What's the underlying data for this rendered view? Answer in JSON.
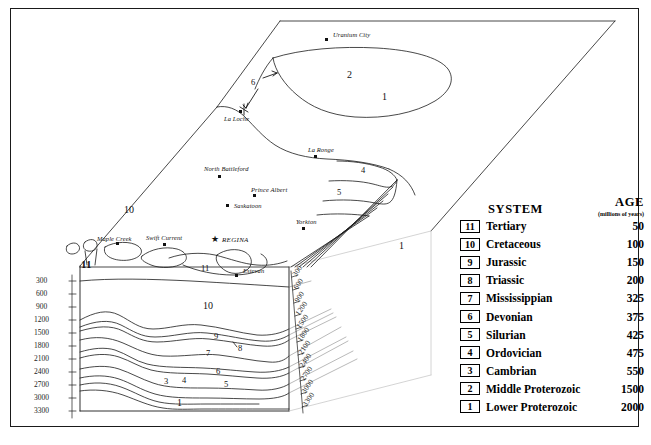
{
  "legend": {
    "system_header": "SYSTEM",
    "age_header": "AGE",
    "age_subheader": "(millions of years)",
    "rows": [
      {
        "num": "11",
        "name": "Tertiary",
        "age": "50"
      },
      {
        "num": "10",
        "name": "Cretaceous",
        "age": "100"
      },
      {
        "num": "9",
        "name": "Jurassic",
        "age": "150"
      },
      {
        "num": "8",
        "name": "Triassic",
        "age": "200"
      },
      {
        "num": "7",
        "name": "Mississippian",
        "age": "325"
      },
      {
        "num": "6",
        "name": "Devonian",
        "age": "375"
      },
      {
        "num": "5",
        "name": "Silurian",
        "age": "425"
      },
      {
        "num": "4",
        "name": "Ordovician",
        "age": "475"
      },
      {
        "num": "3",
        "name": "Cambrian",
        "age": "550"
      },
      {
        "num": "2",
        "name": "Middle Proterozoic",
        "age": "1500"
      },
      {
        "num": "1",
        "name": "Lower Proterozoic",
        "age": "2000"
      }
    ]
  },
  "cities": [
    {
      "name": "Uranium City",
      "x": 325,
      "y": 28
    },
    {
      "name": "La Loche",
      "x": 221,
      "y": 106
    },
    {
      "name": "La Ronge",
      "x": 300,
      "y": 143
    },
    {
      "name": "North Battleford",
      "x": 199,
      "y": 159
    },
    {
      "name": "Prince Albert",
      "x": 233,
      "y": 180
    },
    {
      "name": "Saskatoon",
      "x": 228,
      "y": 196
    },
    {
      "name": "Yorkton",
      "x": 288,
      "y": 212
    },
    {
      "name": "Maple Creek",
      "x": 101,
      "y": 229
    },
    {
      "name": "Swift Current",
      "x": 147,
      "y": 229
    },
    {
      "name": "REGINA",
      "x": 216,
      "y": 228
    },
    {
      "name": "Estevan",
      "x": 235,
      "y": 261
    }
  ],
  "map_unit_labels": [
    {
      "text": "2",
      "x": 336,
      "y": 65
    },
    {
      "text": "1",
      "x": 371,
      "y": 87
    },
    {
      "text": "6",
      "x": 244,
      "y": 74
    },
    {
      "text": "4",
      "x": 352,
      "y": 161
    },
    {
      "text": "5",
      "x": 328,
      "y": 183
    },
    {
      "text": "10",
      "x": 117,
      "y": 201
    },
    {
      "text": "11",
      "x": 75,
      "y": 254
    },
    {
      "text": "11",
      "x": 193,
      "y": 259
    },
    {
      "text": "1",
      "x": 389,
      "y": 236
    }
  ],
  "section_unit_labels": [
    {
      "text": "10",
      "x": 195,
      "y": 297
    },
    {
      "text": "9",
      "x": 205,
      "y": 327
    },
    {
      "text": "8",
      "x": 227,
      "y": 338
    },
    {
      "text": "7",
      "x": 197,
      "y": 343
    },
    {
      "text": "6",
      "x": 207,
      "y": 362
    },
    {
      "text": "3",
      "x": 155,
      "y": 372
    },
    {
      "text": "4",
      "x": 173,
      "y": 371
    },
    {
      "text": "5",
      "x": 215,
      "y": 375
    },
    {
      "text": "1",
      "x": 168,
      "y": 394
    }
  ],
  "depth_axis": {
    "left_ticks": [
      "300",
      "600",
      "900",
      "1200",
      "1500",
      "1800",
      "2100",
      "2400",
      "2700",
      "3000",
      "3300"
    ],
    "right_ticks": [
      "300",
      "600",
      "900",
      "1200",
      "1500",
      "1800",
      "2100",
      "2400",
      "2700",
      "3000",
      "3300"
    ]
  },
  "colors": {
    "line": "#1a1a1a",
    "frame": "#1a1a1a",
    "background": "#ffffff"
  }
}
